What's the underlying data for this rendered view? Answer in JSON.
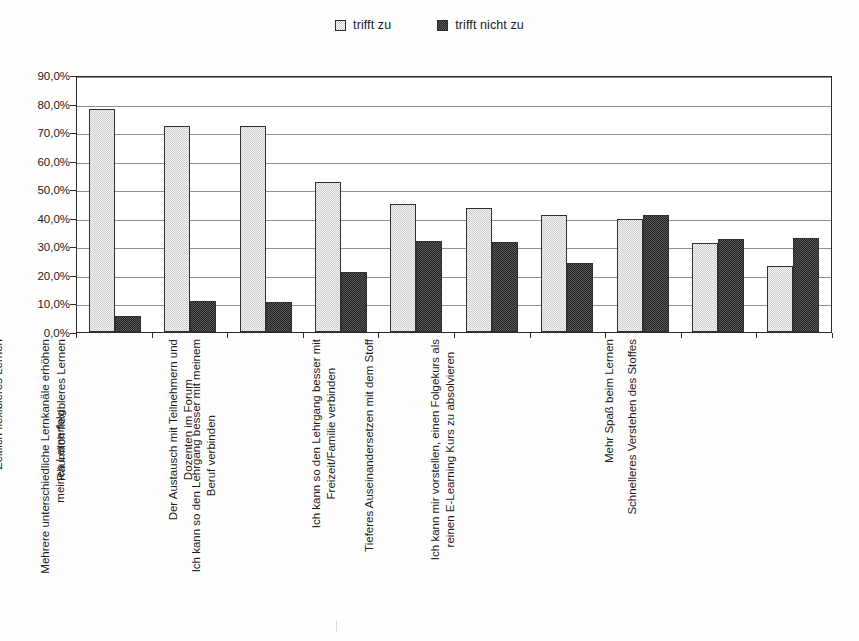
{
  "legend": {
    "position": "top-center",
    "entries": [
      {
        "label": "trifft zu",
        "swatch": "light-hatched-swatch",
        "color": "#cbcbcb"
      },
      {
        "label": "trifft nicht zu",
        "swatch": "dark-solid-swatch",
        "color": "#232323"
      }
    ]
  },
  "axis": {
    "y_ticks": [
      "0,0%",
      "10,0%",
      "20,0%",
      "30,0%",
      "40,0%",
      "50,0%",
      "60,0%",
      "70,0%",
      "80,0%",
      "90,0%"
    ]
  },
  "chart_data": {
    "type": "bar",
    "title": "",
    "subtitle": "",
    "xlabel": "",
    "ylabel": "",
    "ylim": [
      0,
      90
    ],
    "ytick_step": 10,
    "ytick_format": "percent-comma",
    "grid": true,
    "legend_position": "top-center",
    "orientation": "vertical-grouped",
    "categories": [
      "Zeitlich flexibleres Lernen",
      "Räumlich flexibleres Lernen",
      "Mehrere unterschiedliche Lernkanäle erhöhen meinen Lernerfolg",
      "Der Austausch mit Teilnehmern und Dozenten im Forum",
      "Ich kann so den Lehrgang besser mit meinem Beruf verbinden",
      "Ich kann so den Lehrgang besser mit Freizeit/Familie verbinden",
      "Tieferes Auseinandersetzen mit dem Stoff",
      "Ich kann mir vorstellen, einen Folgekurs als reinen E-Learning Kurs zu absolvieren",
      "Mehr Spaß beim Lernen",
      "Schnelleres Verstehen des Stoffes"
    ],
    "category_lines": [
      [
        "Zeitlich flexibleres Lernen"
      ],
      [
        "Räumlich flexibleres Lernen"
      ],
      [
        "Mehrere unterschiedliche Lernkanäle erhöhen",
        "meinen Lernerfolg"
      ],
      [
        "Der Austausch mit Teilnehmern und",
        "Dozenten im Forum"
      ],
      [
        "Ich kann so den Lehrgang besser mit meinem",
        "Beruf verbinden"
      ],
      [
        "Ich kann so den Lehrgang besser mit",
        "Freizeit/Familie verbinden"
      ],
      [
        "Tieferes Auseinandersetzen mit dem Stoff"
      ],
      [
        "Ich kann mir vorstellen, einen Folgekurs als",
        "reinen E-Learning Kurs zu absolvieren"
      ],
      [
        "Mehr Spaß beim Lernen"
      ],
      [
        "Schnelleres Verstehen des Stoffes"
      ]
    ],
    "series": [
      {
        "name": "trifft zu",
        "color": "#cbcbcb",
        "values": [
          78.0,
          72.0,
          72.0,
          52.5,
          45.0,
          43.5,
          41.0,
          39.5,
          31.0,
          23.0
        ]
      },
      {
        "name": "trifft nicht zu",
        "color": "#232323",
        "values": [
          5.5,
          11.0,
          10.5,
          21.0,
          31.8,
          31.5,
          24.0,
          41.0,
          32.5,
          33.0
        ]
      }
    ]
  }
}
